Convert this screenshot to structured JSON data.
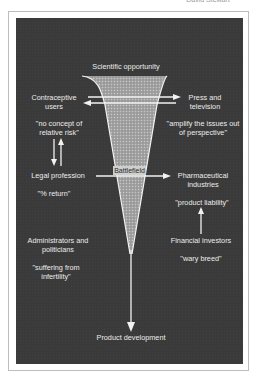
{
  "header": {
    "top_caption": "David Stewart"
  },
  "diagram": {
    "center": {
      "top": "Scientific opportunity",
      "middle": "Battlefield",
      "bottom": "Product development"
    },
    "left": {
      "contraceptive_users": "Contraceptive users",
      "contraceptive_users_quote": "\"no concept of relative risk\"",
      "legal_profession": "Legal profession",
      "legal_profession_quote": "\"% return\"",
      "administrators": "Administrators and politicians",
      "administrators_quote": "\"suffering from infertility\""
    },
    "right": {
      "press": "Press and television",
      "press_quote": "\"amplify the issues out of perspective\"",
      "pharma": "Pharmaceutical industries",
      "pharma_quote": "\"product liability\"",
      "investors": "Financial investors",
      "investors_quote": "\"wary breed\""
    },
    "colors": {
      "background_panel": "#3a3a3a",
      "text": "#ececec",
      "lines": "#f2f2f2",
      "funnel_fill": "#9c9c9c"
    }
  }
}
